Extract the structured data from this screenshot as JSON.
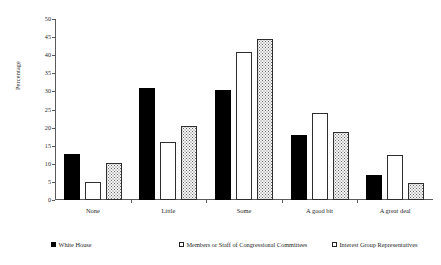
{
  "chart_data": {
    "type": "bar",
    "title": "",
    "subtitle": "",
    "xlabel": "",
    "ylabel": "Percentage",
    "ylim": [
      0,
      50
    ],
    "ytick_step": 5,
    "yticks": [
      "0",
      "5",
      "10",
      "15",
      "20",
      "25",
      "30",
      "35",
      "40",
      "45",
      "50"
    ],
    "grid": false,
    "legend_position": "bottom",
    "categories": [
      "None",
      "Little",
      "Some",
      "A good bit",
      "A great deal"
    ],
    "series": [
      {
        "name": "White House",
        "swatch": "solid-black",
        "values": [
          12.7,
          31.0,
          30.3,
          18.0,
          7.0
        ]
      },
      {
        "name": "Members or Staff of Congressional Committees",
        "swatch": "open-white",
        "values": [
          5.0,
          16.0,
          41.0,
          24.0,
          12.3
        ]
      },
      {
        "name": "Interest Group Representatives",
        "swatch": "dotted",
        "values": [
          10.3,
          20.5,
          44.5,
          18.7,
          4.7
        ]
      }
    ],
    "colors": {
      "series_0": "#000000",
      "series_1": "#ffffff",
      "series_2": "#f4f4f4",
      "axis": "#5a5a5a",
      "text": "#1f1f1f",
      "background": "#ffffff"
    }
  }
}
